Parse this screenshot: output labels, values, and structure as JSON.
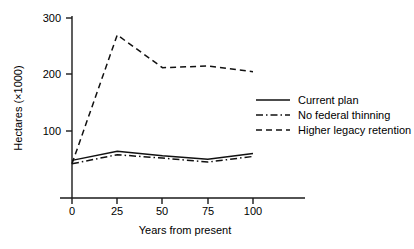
{
  "chart_data": {
    "type": "line",
    "title": "",
    "xlabel": "Years from present",
    "ylabel": "Hectares (×1000)",
    "x": [
      0,
      25,
      50,
      75,
      100
    ],
    "xticks": [
      0,
      25,
      50,
      75,
      100
    ],
    "xticklabels": [
      "0",
      "25",
      "50",
      "75",
      "100"
    ],
    "yticks": [
      100,
      200,
      300
    ],
    "yticklabels": [
      "100",
      "200",
      "300"
    ],
    "xlim": [
      0,
      100
    ],
    "ylim": [
      0,
      300
    ],
    "grid": false,
    "legend_position": "center right",
    "series": [
      {
        "name": "Current plan",
        "style": "solid",
        "color": "#111111",
        "values": [
          48,
          64,
          56,
          50,
          60
        ]
      },
      {
        "name": "No federal thinning",
        "style": "dash-dot",
        "color": "#111111",
        "values": [
          42,
          58,
          52,
          45,
          55
        ]
      },
      {
        "name": "Higher legacy retention",
        "style": "dashed",
        "color": "#111111",
        "values": [
          42,
          270,
          212,
          215,
          205
        ]
      }
    ]
  },
  "axes": {
    "y_label": "Hectares (×1000)",
    "x_label": "Years from present",
    "y_tick_300": "300",
    "y_tick_200": "200",
    "y_tick_100": "100",
    "x_tick_0": "0",
    "x_tick_25": "25",
    "x_tick_50": "50",
    "x_tick_75": "75",
    "x_tick_100": "100"
  },
  "legend": {
    "entries": [
      {
        "label": "Current plan",
        "style": "solid"
      },
      {
        "label": "No federal thinning",
        "style": "dash-dot"
      },
      {
        "label": "Higher legacy retention",
        "style": "dashed"
      }
    ]
  }
}
